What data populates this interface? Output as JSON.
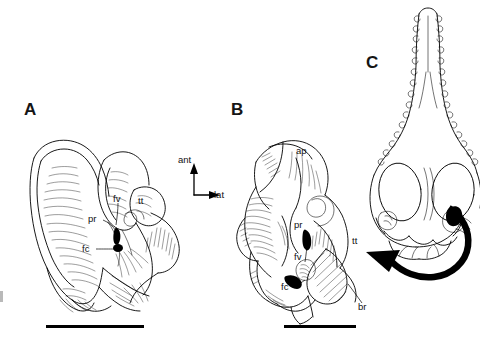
{
  "figure": {
    "background_color": "#ffffff",
    "ink_color": "#000000"
  },
  "panels": [
    {
      "id": "A",
      "letter": "A",
      "view": "ventral view of left ear region",
      "labels": [
        {
          "key": "fv",
          "text": "fv",
          "meaning": "fenestra vestibuli",
          "x": 113,
          "y": 198
        },
        {
          "key": "pr",
          "text": "pr",
          "meaning": "promontorium",
          "x": 90,
          "y": 218
        },
        {
          "key": "fc",
          "text": "fc",
          "meaning": "fenestra cochleae",
          "x": 84,
          "y": 247
        },
        {
          "key": "tt",
          "text": "tt",
          "meaning": "tegmen tympani",
          "x": 139,
          "y": 200
        }
      ]
    },
    {
      "id": "B",
      "letter": "B",
      "view": "enlarged oblique view of ear region",
      "labels": [
        {
          "key": "ap",
          "text": "ap",
          "meaning": "anterior process",
          "x": 297,
          "y": 150
        },
        {
          "key": "pr",
          "text": "pr",
          "meaning": "promontorium",
          "x": 296,
          "y": 224
        },
        {
          "key": "fv",
          "text": "fv",
          "meaning": "fenestra vestibuli",
          "x": 296,
          "y": 256
        },
        {
          "key": "fc",
          "text": "fc",
          "meaning": "fenestra cochleae",
          "x": 283,
          "y": 286
        },
        {
          "key": "tt",
          "text": "tt",
          "meaning": "tegmen tympani",
          "x": 353,
          "y": 240
        },
        {
          "key": "br",
          "text": "br",
          "meaning": "broken surface",
          "x": 359,
          "y": 306
        }
      ]
    },
    {
      "id": "C",
      "letter": "C",
      "view": "dorsal view of skull showing position of ear region",
      "labels": []
    }
  ],
  "compass": {
    "anterior_label": "ant",
    "lateral_label": "lat",
    "anterior_direction": "up",
    "lateral_direction": "right"
  },
  "arrow": {
    "name": "reference-arrow",
    "description": "curved arrow from skull in panel C pointing to ear region in panel B",
    "direction": "right-to-left"
  },
  "scale_bars": [
    {
      "for_panel": "A",
      "label": "",
      "x": 46,
      "y": 325,
      "width": 98
    },
    {
      "for_panel": "B",
      "label": "",
      "x": 284,
      "y": 325,
      "width": 72
    }
  ]
}
